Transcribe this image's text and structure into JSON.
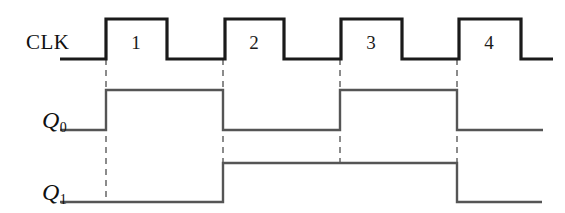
{
  "figure": {
    "type": "digital-timing-diagram",
    "width": 565,
    "height": 213,
    "background_color": "#ffffff",
    "clock_color": "#1a1a1a",
    "signal_color": "#555555",
    "marker_color": "#666666"
  },
  "signals": [
    {
      "id": "clk",
      "label": "CLK",
      "label_style": "upright",
      "label_x": 26,
      "label_y": 42,
      "low_y": 59,
      "high_y": 19,
      "start_x": 60,
      "end_x": 553,
      "initial_state": 0,
      "transitions_x": [
        106,
        167,
        225,
        284,
        341,
        402,
        459,
        521
      ]
    },
    {
      "id": "q0",
      "label": "Q",
      "subscript": "0",
      "label_style": "italic",
      "label_x": 42,
      "label_y": 130,
      "low_y": 130,
      "high_y": 90,
      "start_x": 60,
      "end_x": 543,
      "initial_state": 0,
      "transitions_x": [
        106,
        223,
        340,
        457
      ]
    },
    {
      "id": "q1",
      "label": "Q",
      "subscript": "1",
      "label_style": "italic",
      "label_x": 42,
      "label_y": 202,
      "low_y": 202,
      "high_y": 163,
      "start_x": 60,
      "end_x": 542,
      "initial_state": 0,
      "transitions_x": [
        223,
        457
      ]
    }
  ],
  "cycle_numbers": [
    {
      "label": "1",
      "x": 136,
      "y": 33
    },
    {
      "label": "2",
      "x": 254,
      "y": 33
    },
    {
      "label": "3",
      "x": 371,
      "y": 33
    },
    {
      "label": "4",
      "x": 489,
      "y": 33
    }
  ],
  "edge_markers": [
    {
      "x": 106,
      "y_top": 59,
      "y_bottom": 202
    },
    {
      "x": 223,
      "y_top": 59,
      "y_bottom": 202
    },
    {
      "x": 340,
      "y_top": 59,
      "y_bottom": 163
    },
    {
      "x": 457,
      "y_top": 59,
      "y_bottom": 163
    }
  ],
  "waveform_paths": {
    "clk": "M 60 59 L 106 59 L 106 19 L 167 19 L 167 59 L 225 59 L 225 19 L 284 19 L 284 59 L 341 59 L 341 19 L 402 19 L 402 59 L 459 59 L 459 19 L 521 19 L 521 59 L 553 59",
    "q0": "M 60 130 L 106 130 L 106 90 L 223 90 L 223 130 L 340 130 L 340 90 L 457 90 L 457 130 L 543 130",
    "q1": "M 60 202 L 223 202 L 223 163 L 457 163 L 457 202 L 542 202"
  }
}
